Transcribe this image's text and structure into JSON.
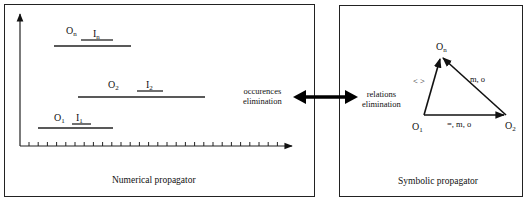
{
  "numerical_propagator": {
    "caption": "Numerical propagator",
    "axis": {
      "vertical": "time-axis-vertical",
      "horizontal": "time-axis-horizontal",
      "tick_count": 28
    },
    "intervals": [
      {
        "occurrence": "O",
        "occurrence_sub": "n",
        "instant": "I",
        "instant_sub": "n"
      },
      {
        "occurrence": "O",
        "occurrence_sub": "2",
        "instant": "I",
        "instant_sub": "2"
      },
      {
        "occurrence": "O",
        "occurrence_sub": "1",
        "instant": "I",
        "instant_sub": "1"
      }
    ]
  },
  "connector": {
    "left_label_line1": "occurences",
    "left_label_line2": "elimination",
    "right_label_line1": "relations",
    "right_label_line2": "elimination",
    "arrow": "double-headed-arrow"
  },
  "symbolic_propagator": {
    "caption": "Symbolic propagator",
    "nodes": [
      {
        "name": "O",
        "sub": "n"
      },
      {
        "name": "O",
        "sub": "1"
      },
      {
        "name": "O",
        "sub": "2"
      }
    ],
    "edges": [
      {
        "from": "O1",
        "to": "On",
        "label": "< >"
      },
      {
        "from": "O2",
        "to": "On",
        "label": "m, o"
      },
      {
        "from": "O1",
        "to": "O2",
        "label": "=, m, o"
      }
    ]
  }
}
